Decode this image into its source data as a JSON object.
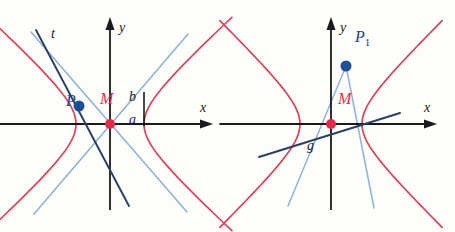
{
  "figure": {
    "background_color": "#fdfdfa",
    "colors": {
      "hyperbola": "#d6445f",
      "asymptote": "#8fb4d4",
      "line_dark": "#2a3f66",
      "point_blue": "#1c4f9c",
      "point_red": "#e8284a",
      "axis": "#1a1a1a",
      "label_blue": "#22418c",
      "label_red": "#e8284a",
      "label_dark": "#1a1a2e"
    },
    "panels": [
      {
        "id": "left-panel",
        "name": "tangent-line-panel",
        "axes": {
          "x_label": "x",
          "y_label": "y",
          "origin": {
            "x": 110,
            "y": 124
          },
          "x_arrow_tip": {
            "x": 213,
            "y": 124
          },
          "y_arrow_tip": {
            "x": 110,
            "y": 17
          }
        },
        "hyperbola": {
          "center": {
            "x": 110,
            "y": 124
          },
          "a": 34,
          "b": 31,
          "vertex_left": {
            "x": 76,
            "y": 124
          },
          "vertex_right": {
            "x": 144,
            "y": 124
          }
        },
        "points": [
          {
            "name": "P1",
            "label": "P",
            "subscript": "1",
            "label_x": 66,
            "label_y": 106,
            "dot_x": 79,
            "dot_y": 106,
            "color": "#1c4f9c"
          },
          {
            "name": "M",
            "label": "M",
            "subscript": "",
            "label_x": 100,
            "label_y": 104,
            "dot_x": 110,
            "dot_y": 124,
            "color": "#e8284a"
          }
        ],
        "lines": [
          {
            "name": "tangent-line-t",
            "label": "t",
            "label_x": 51,
            "label_y": 38,
            "x1": 36,
            "y1": 30,
            "x2": 129,
            "y2": 206,
            "color": "#2a3f66"
          }
        ],
        "asymptotes": [
          {
            "name": "asymptote-falling",
            "x1": 31,
            "y1": 32,
            "x2": 187,
            "y2": 212
          },
          {
            "name": "asymptote-rising",
            "x1": 34,
            "y1": 214,
            "x2": 188,
            "y2": 34
          }
        ],
        "tick": {
          "name": "ab-tick",
          "x": 144,
          "y_top": 92,
          "y_bottom": 126,
          "label_b": "b",
          "label_b_x": 129,
          "label_b_y": 101,
          "label_a": "a",
          "label_a_x": 129,
          "label_a_y": 124
        }
      },
      {
        "id": "right-panel",
        "name": "secant-line-panel",
        "axes": {
          "x_label": "x",
          "y_label": "y",
          "origin": {
            "x": 331,
            "y": 124
          },
          "x_arrow_tip": {
            "x": 437,
            "y": 124
          },
          "y_arrow_tip": {
            "x": 331,
            "y": 17
          }
        },
        "hyperbola": {
          "center": {
            "x": 331,
            "y": 124
          },
          "a": 31,
          "b": 30,
          "vertex_left": {
            "x": 300,
            "y": 124
          },
          "vertex_right": {
            "x": 362,
            "y": 124
          }
        },
        "points": [
          {
            "name": "P1",
            "label": "P",
            "subscript": "1",
            "label_x": 355,
            "label_y": 42,
            "dot_x": 346,
            "dot_y": 66,
            "color": "#1c4f9c"
          },
          {
            "name": "M",
            "label": "M",
            "subscript": "",
            "label_x": 338,
            "label_y": 104,
            "dot_x": 331,
            "dot_y": 124,
            "color": "#e8284a"
          }
        ],
        "lines": [
          {
            "name": "secant-line-g",
            "label": "g",
            "label_x": 307,
            "label_y": 150,
            "x1": 259,
            "y1": 157,
            "x2": 400,
            "y2": 113,
            "color": "#2a3f66"
          }
        ],
        "chords": [
          {
            "name": "chord-P1-left",
            "x1": 346,
            "y1": 66,
            "x2": 288,
            "y2": 206
          },
          {
            "name": "chord-P1-right",
            "x1": 346,
            "y1": 66,
            "x2": 374,
            "y2": 208
          }
        ]
      }
    ]
  }
}
